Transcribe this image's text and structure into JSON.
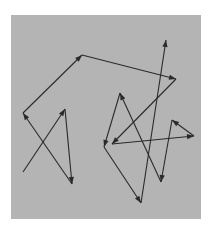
{
  "diagram": {
    "background": "#ffffff",
    "panel": {
      "x": 11,
      "y": 15,
      "width": 190,
      "height": 204,
      "fill": "#b4b4b4"
    },
    "stroke": "#2a2a2a",
    "path_points": [
      [
        23,
        172
      ],
      [
        65,
        109
      ],
      [
        72,
        184
      ],
      [
        23,
        113
      ],
      [
        82,
        55
      ],
      [
        176,
        79
      ],
      [
        112,
        144
      ],
      [
        194,
        136
      ],
      [
        172,
        120
      ],
      [
        161,
        182
      ],
      [
        120,
        93
      ],
      [
        104,
        147
      ],
      [
        141,
        203
      ],
      [
        166,
        40
      ]
    ],
    "arrowheads_at_end_of_each_segment": true
  }
}
